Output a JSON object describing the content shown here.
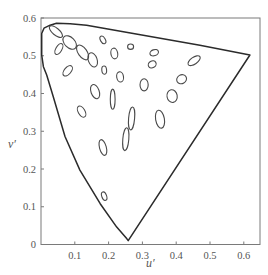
{
  "chart_data": {
    "type": "scatter",
    "title": "",
    "xlabel": "u′",
    "ylabel": "v′",
    "xlim": [
      0,
      0.646
    ],
    "ylim": [
      0,
      0.6
    ],
    "grid": false,
    "legend": null,
    "x_ticks": [
      {
        "value": 0.1,
        "label": "0.1"
      },
      {
        "value": 0.2,
        "label": "0.2"
      },
      {
        "value": 0.3,
        "label": "0.3"
      },
      {
        "value": 0.4,
        "label": "0.4"
      },
      {
        "value": 0.5,
        "label": "0.5"
      },
      {
        "value": 0.6,
        "label": "0.6"
      }
    ],
    "y_ticks": [
      {
        "value": 0.0,
        "label": "0"
      },
      {
        "value": 0.1,
        "label": "0.1"
      },
      {
        "value": 0.2,
        "label": "0.2"
      },
      {
        "value": 0.3,
        "label": "0.3"
      },
      {
        "value": 0.4,
        "label": "0.4"
      },
      {
        "value": 0.5,
        "label": "0.5"
      },
      {
        "value": 0.6,
        "label": "0.6"
      }
    ],
    "spectral_locus": [
      [
        0.258,
        0.01
      ],
      [
        0.254,
        0.015
      ],
      [
        0.224,
        0.046
      ],
      [
        0.175,
        0.108
      ],
      [
        0.115,
        0.197
      ],
      [
        0.071,
        0.286
      ],
      [
        0.036,
        0.392
      ],
      [
        0.017,
        0.449
      ],
      [
        0.007,
        0.471
      ],
      [
        0.002,
        0.502
      ],
      [
        0.002,
        0.559
      ],
      [
        0.009,
        0.573
      ],
      [
        0.027,
        0.581
      ],
      [
        0.046,
        0.586
      ],
      [
        0.086,
        0.585
      ],
      [
        0.135,
        0.581
      ],
      [
        0.273,
        0.559
      ],
      [
        0.47,
        0.528
      ],
      [
        0.618,
        0.502
      ],
      [
        0.258,
        0.01
      ]
    ],
    "ellipses": [
      {
        "u": 0.044,
        "v": 0.564,
        "a": 0.024,
        "b": 0.01,
        "angle_deg": 40
      },
      {
        "u": 0.085,
        "v": 0.535,
        "a": 0.024,
        "b": 0.015,
        "angle_deg": 45
      },
      {
        "u": 0.053,
        "v": 0.518,
        "a": 0.018,
        "b": 0.009,
        "angle_deg": -60
      },
      {
        "u": 0.123,
        "v": 0.509,
        "a": 0.025,
        "b": 0.013,
        "angle_deg": 55
      },
      {
        "u": 0.183,
        "v": 0.542,
        "a": 0.012,
        "b": 0.007,
        "angle_deg": 60
      },
      {
        "u": 0.079,
        "v": 0.46,
        "a": 0.018,
        "b": 0.01,
        "angle_deg": -50
      },
      {
        "u": 0.153,
        "v": 0.489,
        "a": 0.022,
        "b": 0.013,
        "angle_deg": 70
      },
      {
        "u": 0.217,
        "v": 0.506,
        "a": 0.016,
        "b": 0.01,
        "angle_deg": 80
      },
      {
        "u": 0.187,
        "v": 0.462,
        "a": 0.012,
        "b": 0.007,
        "angle_deg": 85
      },
      {
        "u": 0.234,
        "v": 0.444,
        "a": 0.015,
        "b": 0.01,
        "angle_deg": 80
      },
      {
        "u": 0.265,
        "v": 0.524,
        "a": 0.009,
        "b": 0.008,
        "angle_deg": 0
      },
      {
        "u": 0.335,
        "v": 0.508,
        "a": 0.013,
        "b": 0.009,
        "angle_deg": -20
      },
      {
        "u": 0.329,
        "v": 0.477,
        "a": 0.012,
        "b": 0.01,
        "angle_deg": -30
      },
      {
        "u": 0.453,
        "v": 0.487,
        "a": 0.021,
        "b": 0.01,
        "angle_deg": -35
      },
      {
        "u": 0.416,
        "v": 0.438,
        "a": 0.015,
        "b": 0.013,
        "angle_deg": -30
      },
      {
        "u": 0.305,
        "v": 0.423,
        "a": 0.018,
        "b": 0.012,
        "angle_deg": 90
      },
      {
        "u": 0.388,
        "v": 0.393,
        "a": 0.019,
        "b": 0.015,
        "angle_deg": 80
      },
      {
        "u": 0.16,
        "v": 0.405,
        "a": 0.022,
        "b": 0.012,
        "angle_deg": 70
      },
      {
        "u": 0.212,
        "v": 0.385,
        "a": 0.03,
        "b": 0.007,
        "angle_deg": 90
      },
      {
        "u": 0.12,
        "v": 0.352,
        "a": 0.018,
        "b": 0.01,
        "angle_deg": 60
      },
      {
        "u": 0.268,
        "v": 0.334,
        "a": 0.034,
        "b": 0.009,
        "angle_deg": 95
      },
      {
        "u": 0.352,
        "v": 0.332,
        "a": 0.027,
        "b": 0.013,
        "angle_deg": 80
      },
      {
        "u": 0.251,
        "v": 0.279,
        "a": 0.034,
        "b": 0.009,
        "angle_deg": 95
      },
      {
        "u": 0.183,
        "v": 0.257,
        "a": 0.024,
        "b": 0.01,
        "angle_deg": 75
      },
      {
        "u": 0.187,
        "v": 0.128,
        "a": 0.013,
        "b": 0.007,
        "angle_deg": 70
      }
    ]
  },
  "colors": {
    "locus": "#2b2b2b",
    "ellipse": "#4a4a4a",
    "axis": "#7a7a7a",
    "text": "#555555"
  }
}
